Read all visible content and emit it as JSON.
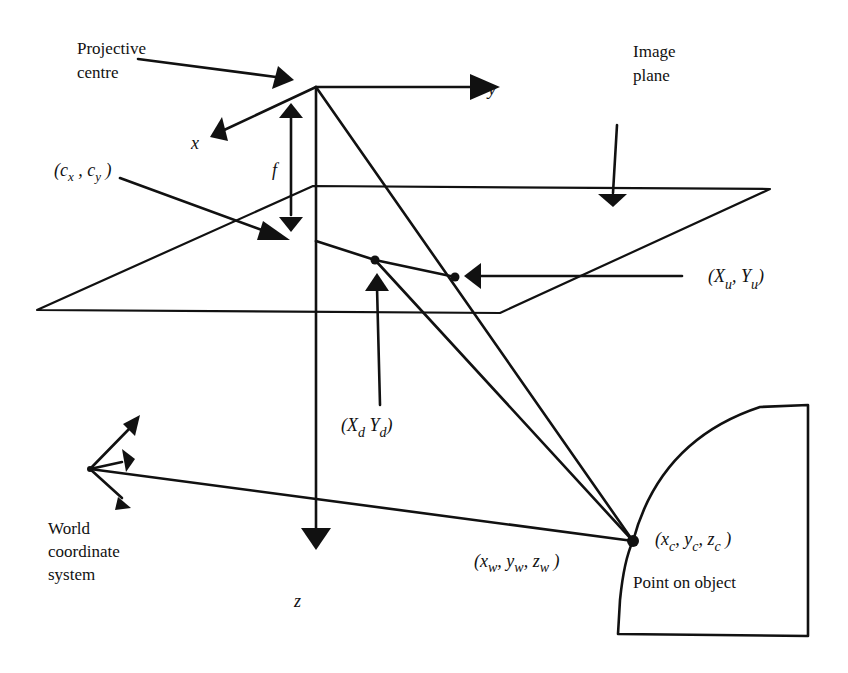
{
  "figure": {
    "labels": {
      "projective_centre_line1": "Projective",
      "projective_centre_line2": "centre",
      "axis_x": "x",
      "axis_y": "y",
      "axis_z": "z",
      "focal_length": "f",
      "principal_point": "(c",
      "principal_point_x_sub": "x",
      "principal_point_sep": " , c",
      "principal_point_y_sub": "y",
      "principal_point_close": " )",
      "image_plane_line1": "Image",
      "image_plane_line2": "plane",
      "undistorted_open": "(X",
      "undistorted_u1": "u",
      "undistorted_mid": ", Y",
      "undistorted_u2": "u",
      "undistorted_close": ")",
      "distorted_open": "(X",
      "distorted_d1": "d",
      "distorted_mid": " Y",
      "distorted_d2": "d",
      "distorted_close": ")",
      "world_line1": "World",
      "world_line2": "coordinate",
      "world_line3": "system",
      "world_point_open": "(x",
      "world_point_w1": "w",
      "world_point_y": ", y",
      "world_point_w2": "w",
      "world_point_z": ",  z",
      "world_point_w3": "w",
      "world_point_close": " )",
      "camera_point_open": "(x",
      "camera_point_c1": "c",
      "camera_point_y": ", y",
      "camera_point_c2": "c",
      "camera_point_z": ",  z",
      "camera_point_c3": "c",
      "camera_point_close": " )",
      "object_label": "Point on object"
    },
    "colors": {
      "ink": "#111111",
      "background": "#ffffff"
    }
  }
}
